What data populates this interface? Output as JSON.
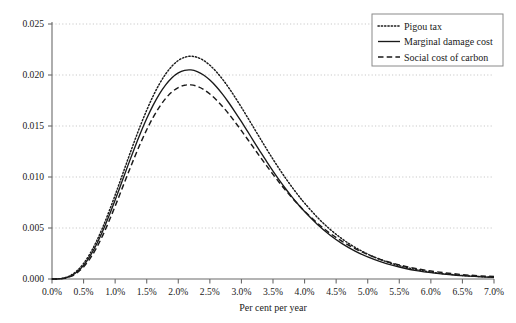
{
  "chart_data": {
    "type": "line",
    "title": "",
    "xlabel": "Per cent per year",
    "ylabel": "",
    "xlim": [
      0.0,
      7.0
    ],
    "ylim": [
      0.0,
      0.025
    ],
    "grid": true,
    "legend_position": "top-right",
    "x_tick_labels": [
      "0.0%",
      "0.5%",
      "1.0%",
      "1.5%",
      "2.0%",
      "2.5%",
      "3.0%",
      "3.5%",
      "4.0%",
      "4.5%",
      "5.0%",
      "5.5%",
      "6.0%",
      "6.5%",
      "7.0%"
    ],
    "x_ticks": [
      0.0,
      0.5,
      1.0,
      1.5,
      2.0,
      2.5,
      3.0,
      3.5,
      4.0,
      4.5,
      5.0,
      5.5,
      6.0,
      6.5,
      7.0
    ],
    "y_tick_labels": [
      "0.000",
      "0.005",
      "0.010",
      "0.015",
      "0.020",
      "0.025"
    ],
    "y_ticks": [
      0.0,
      0.005,
      0.01,
      0.015,
      0.02,
      0.025
    ],
    "x": [
      0.0,
      0.1,
      0.2,
      0.3,
      0.4,
      0.5,
      0.6,
      0.7,
      0.8,
      0.9,
      1.0,
      1.1,
      1.2,
      1.3,
      1.4,
      1.5,
      1.6,
      1.7,
      1.8,
      1.9,
      2.0,
      2.1,
      2.2,
      2.3,
      2.4,
      2.5,
      2.6,
      2.7,
      2.8,
      2.9,
      3.0,
      3.1,
      3.2,
      3.3,
      3.4,
      3.5,
      3.6,
      3.7,
      3.8,
      3.9,
      4.0,
      4.2,
      4.4,
      4.6,
      4.8,
      5.0,
      5.2,
      5.4,
      5.6,
      5.8,
      6.0,
      6.2,
      6.4,
      6.6,
      6.8,
      7.0
    ],
    "series": [
      {
        "name": "Pigou tax",
        "style": "dotted",
        "color": "#1a1a1a",
        "peak_x": 1.85,
        "peak_y": 0.024,
        "values": [
          0.0,
          2e-05,
          0.00012,
          0.00037,
          0.00083,
          0.00152,
          0.00246,
          0.00364,
          0.00502,
          0.00657,
          0.00823,
          0.00996,
          0.0117,
          0.01341,
          0.01504,
          0.01655,
          0.01792,
          0.01911,
          0.0201,
          0.02087,
          0.02142,
          0.02174,
          0.02184,
          0.02173,
          0.02143,
          0.02096,
          0.02034,
          0.01959,
          0.01874,
          0.01781,
          0.01683,
          0.01581,
          0.01478,
          0.01375,
          0.01273,
          0.01174,
          0.01079,
          0.00988,
          0.00902,
          0.0082,
          0.00744,
          0.00606,
          0.00489,
          0.00391,
          0.0031,
          0.00244,
          0.00191,
          0.00149,
          0.00115,
          0.00089,
          0.00068,
          0.00052,
          0.0004,
          0.0003,
          0.00023,
          0.00017
        ]
      },
      {
        "name": "Marginal damage cost",
        "style": "solid",
        "color": "#1a1a1a",
        "peak_x": 2.0,
        "peak_y": 0.0203,
        "values": [
          0.0,
          1e-05,
          9e-05,
          0.0003,
          0.00071,
          0.00134,
          0.00222,
          0.00333,
          0.00465,
          0.00614,
          0.00774,
          0.00941,
          0.01109,
          0.01273,
          0.01429,
          0.01573,
          0.01702,
          0.01813,
          0.01904,
          0.01974,
          0.02021,
          0.02046,
          0.0205,
          0.02034,
          0.02,
          0.0195,
          0.01887,
          0.01812,
          0.01728,
          0.01637,
          0.01542,
          0.01444,
          0.01345,
          0.01247,
          0.01151,
          0.01058,
          0.00969,
          0.00885,
          0.00805,
          0.00731,
          0.00661,
          0.00537,
          0.00432,
          0.00345,
          0.00274,
          0.00216,
          0.0017,
          0.00133,
          0.00103,
          0.0008,
          0.00062,
          0.00048,
          0.00037,
          0.00028,
          0.00021,
          0.00016
        ]
      },
      {
        "name": "Social cost of carbon",
        "style": "dashed",
        "color": "#1a1a1a",
        "peak_x": 2.1,
        "peak_y": 0.0182,
        "values": [
          0.0,
          1e-05,
          7e-05,
          0.00025,
          0.00062,
          0.00118,
          0.00198,
          0.003,
          0.00423,
          0.00563,
          0.00714,
          0.00871,
          0.01029,
          0.01183,
          0.01329,
          0.01463,
          0.01583,
          0.01686,
          0.0177,
          0.01834,
          0.01877,
          0.019,
          0.01903,
          0.01889,
          0.01859,
          0.01814,
          0.01758,
          0.01692,
          0.01618,
          0.01538,
          0.01454,
          0.01368,
          0.01281,
          0.01194,
          0.01109,
          0.01026,
          0.00946,
          0.0087,
          0.00797,
          0.00729,
          0.00665,
          0.00549,
          0.0045,
          0.00367,
          0.00297,
          0.0024,
          0.00193,
          0.00155,
          0.00124,
          0.00098,
          0.00078,
          0.00062,
          0.00049,
          0.00038,
          0.0003,
          0.00024
        ]
      }
    ]
  },
  "legend": {
    "items": [
      {
        "label": "Pigou tax",
        "style": "dotted"
      },
      {
        "label": "Marginal damage cost",
        "style": "solid"
      },
      {
        "label": "Social cost of carbon",
        "style": "dashed"
      }
    ]
  },
  "colors": {
    "line": "#1a1a1a",
    "grid": "#c9c9c9",
    "axis": "#6b6b6b",
    "legend_border": "#8a8a8a",
    "background": "#ffffff"
  }
}
